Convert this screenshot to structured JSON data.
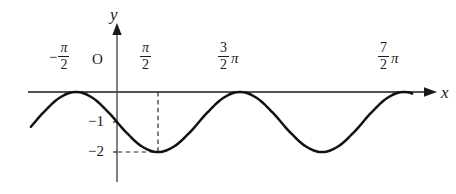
{
  "figure": {
    "type": "math-graph",
    "background_color": "#ffffff",
    "ink_color": "#1a1a1a"
  },
  "axes": {
    "x_axis_label": "x",
    "y_axis_label": "y",
    "origin_label": "O",
    "x_tick_labels": [
      {
        "name": "neg-half-pi",
        "sign": "−",
        "numerator": "π",
        "denominator": "2",
        "trailing": "",
        "value_pi": -0.5
      },
      {
        "name": "half-pi",
        "sign": "",
        "numerator": "π",
        "denominator": "2",
        "trailing": "",
        "value_pi": 0.5
      },
      {
        "name": "three-halves-pi",
        "sign": "",
        "numerator": "3",
        "denominator": "2",
        "trailing": "π",
        "value_pi": 1.5
      },
      {
        "name": "seven-halves-pi",
        "sign": "",
        "numerator": "7",
        "denominator": "2",
        "trailing": "π",
        "value_pi": 3.5
      }
    ],
    "y_tick_labels": [
      {
        "name": "y-tick-minus-one",
        "text": "−1",
        "value": -1
      },
      {
        "name": "y-tick-minus-two",
        "text": "−2",
        "value": -2
      }
    ]
  },
  "chart_data": {
    "type": "line",
    "title": "",
    "xlabel": "x",
    "ylabel": "y",
    "equation": "y = -1 - sin(x)",
    "amplitude": 1,
    "vertical_shift": -1,
    "period_pi": 2,
    "xlim_pi": [
      -1.1,
      3.85
    ],
    "ylim": [
      -2.6,
      0.75
    ],
    "grid": false,
    "legend": false,
    "x_tick_values_pi": [
      -0.5,
      0.5,
      1.5,
      3.5
    ],
    "y_tick_values": [
      -1,
      -2
    ],
    "maxima": [
      {
        "x_pi": -0.5,
        "y": 0
      },
      {
        "x_pi": 1.5,
        "y": 0
      },
      {
        "x_pi": 3.5,
        "y": 0
      }
    ],
    "minima": [
      {
        "x_pi": 0.5,
        "y": -2
      },
      {
        "x_pi": 2.5,
        "y": -2
      }
    ],
    "y_intercept": -1,
    "guide_lines": [
      {
        "name": "vertical-dashed-to-minimum",
        "orientation": "vertical",
        "x_pi": 0.5,
        "from_y": 0,
        "to_y": -2,
        "style": "dashed"
      },
      {
        "name": "horizontal-dashed-to-minimum",
        "orientation": "horizontal",
        "y": -2,
        "from_x_pi": 0,
        "to_x_pi": 0.5,
        "style": "dashed"
      }
    ],
    "x": [
      -1.1,
      -1.05,
      -1.0,
      -0.95,
      -0.9,
      -0.85,
      -0.8,
      -0.75,
      -0.7,
      -0.65,
      -0.6,
      -0.55,
      -0.5,
      -0.45,
      -0.4,
      -0.35,
      -0.3,
      -0.25,
      -0.2,
      -0.15,
      -0.1,
      -0.05,
      0.0,
      0.05,
      0.1,
      0.15,
      0.2,
      0.25,
      0.3,
      0.35,
      0.4,
      0.45,
      0.5,
      0.55,
      0.6,
      0.65,
      0.7,
      0.75,
      0.8,
      0.85,
      0.9,
      0.95,
      1.0,
      1.05,
      1.1,
      1.15,
      1.2,
      1.25,
      1.3,
      1.35,
      1.4,
      1.45,
      1.5,
      1.55,
      1.6,
      1.65,
      1.7,
      1.75,
      1.8,
      1.85,
      1.9,
      1.95,
      2.0,
      2.05,
      2.1,
      2.15,
      2.2,
      2.25,
      2.3,
      2.35,
      2.4,
      2.45,
      2.5,
      2.55,
      2.6,
      2.65,
      2.7,
      2.75,
      2.8,
      2.85,
      2.9,
      2.95,
      3.0,
      3.05,
      3.1,
      3.15,
      3.2,
      3.25,
      3.3,
      3.35,
      3.4,
      3.45,
      3.5,
      3.55,
      3.6,
      3.65,
      3.7,
      3.75,
      3.8,
      3.85
    ],
    "x_unit": "pi",
    "y": [
      -1.31,
      -1.16,
      -1.0,
      -0.84,
      -0.69,
      -0.55,
      -0.41,
      -0.29,
      -0.19,
      -0.11,
      -0.05,
      -0.01,
      0.0,
      -0.01,
      -0.05,
      -0.11,
      -0.19,
      -0.29,
      -0.41,
      -0.55,
      -0.69,
      -0.84,
      -1.0,
      -1.16,
      -1.31,
      -1.45,
      -1.59,
      -1.71,
      -1.81,
      -1.89,
      -1.95,
      -1.99,
      -2.0,
      -1.99,
      -1.95,
      -1.89,
      -1.81,
      -1.71,
      -1.59,
      -1.45,
      -1.31,
      -1.16,
      -1.0,
      -0.84,
      -0.69,
      -0.55,
      -0.41,
      -0.29,
      -0.19,
      -0.11,
      -0.05,
      -0.01,
      0.0,
      -0.01,
      -0.05,
      -0.11,
      -0.19,
      -0.29,
      -0.41,
      -0.55,
      -0.69,
      -0.84,
      -1.0,
      -1.16,
      -1.31,
      -1.45,
      -1.59,
      -1.71,
      -1.81,
      -1.89,
      -1.95,
      -1.99,
      -2.0,
      -1.99,
      -1.95,
      -1.89,
      -1.81,
      -1.71,
      -1.59,
      -1.45,
      -1.31,
      -1.16,
      -1.0,
      -0.84,
      -0.69,
      -0.55,
      -0.41,
      -0.29,
      -0.19,
      -0.11,
      -0.05,
      -0.01,
      0.0,
      -0.01,
      -0.05,
      -0.11,
      -0.19,
      -0.29,
      -0.41,
      -0.55
    ]
  },
  "geometry": {
    "origin_px": {
      "x": 117,
      "y": 92
    },
    "px_per_pi": 82,
    "px_per_unit_y": 30,
    "x_axis_start_px": 28,
    "x_axis_end_px": 432,
    "y_axis_top_px": 28,
    "y_axis_bottom_px": 182,
    "curve_start_x_px": 31,
    "curve_end_x_px": 412
  }
}
